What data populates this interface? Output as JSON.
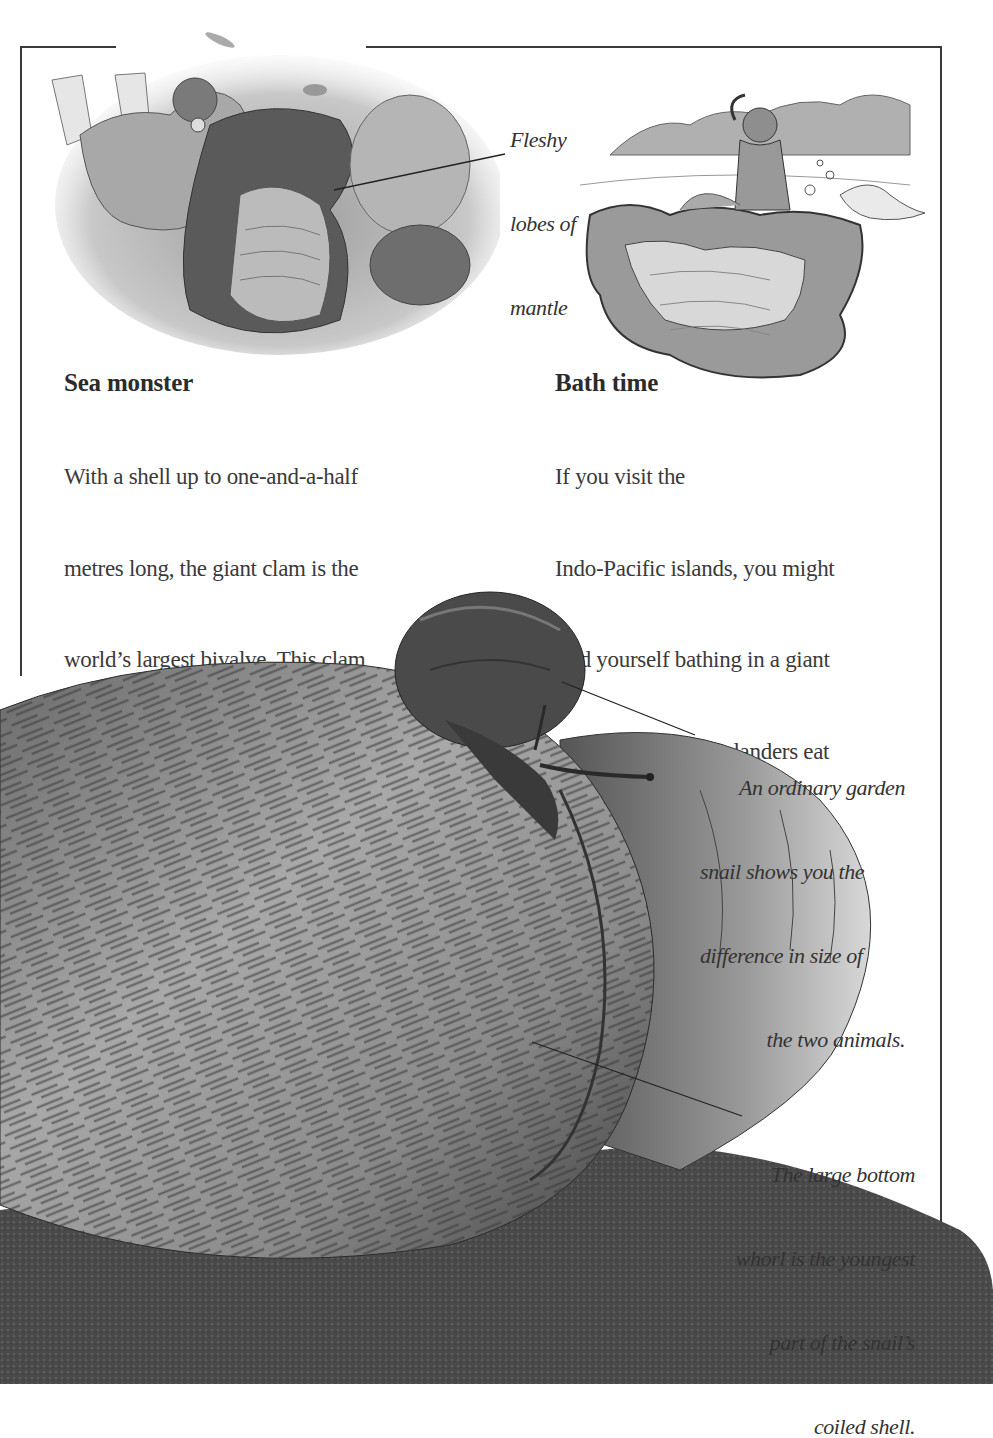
{
  "page": {
    "background": "#ffffff",
    "frame_color": "#3a3a3a"
  },
  "illustrations": {
    "diver_clam": {
      "icon": "diver-with-giant-clam-illustration"
    },
    "bath_clam": {
      "icon": "person-bathing-in-clam-shell-illustration"
    },
    "snails": {
      "icon": "giant-snail-with-garden-snail-photo"
    }
  },
  "captions": {
    "mantle": {
      "lines": [
        "Fleshy",
        "lobes of",
        "mantle"
      ]
    },
    "garden_snail": {
      "lines": [
        "An ordinary garden",
        "snail shows you the",
        "difference in size of",
        "the two animals."
      ]
    },
    "bottom_whorl": {
      "lines": [
        "The large bottom",
        "whorl is the youngest",
        "part of the snail’s",
        "coiled shell."
      ]
    }
  },
  "sections": {
    "sea_monster": {
      "heading": "Sea monster",
      "lines": [
        "With a shell up to one-and-a-half",
        "metres long, the giant clam is the",
        "world’s largest bivalve. This clam",
        "lives on reefs, wedged among",
        "rocks and coral. The shells gape",
        "open most of the time."
      ]
    },
    "bath_time": {
      "heading": "Bath time",
      "lines": [
        "If you visit the",
        "Indo-Pacific islands, you might",
        "find yourself bathing in a giant",
        " clam’s shell! The islanders eat",
        "        the clam’s flesh, and use the",
        "               shells as tubs and troughs."
      ]
    }
  }
}
